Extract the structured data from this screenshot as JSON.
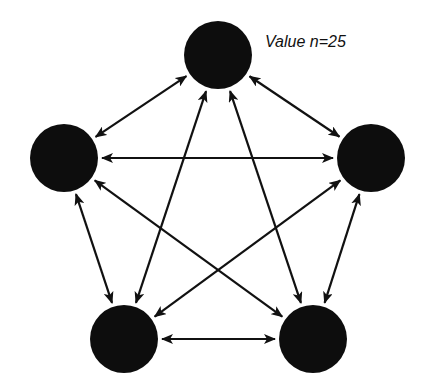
{
  "annotation": {
    "text": "Value n=25",
    "x": 265,
    "y": 33
  },
  "colors": {
    "node": "#0d0d0d",
    "edge": "#111111",
    "background": "#ffffff"
  },
  "nodes": [
    {
      "id": "top",
      "x": 218,
      "y": 55,
      "r": 34
    },
    {
      "id": "left",
      "x": 64,
      "y": 158,
      "r": 34
    },
    {
      "id": "right",
      "x": 371,
      "y": 158,
      "r": 34
    },
    {
      "id": "bottom-left",
      "x": 124,
      "y": 339,
      "r": 34
    },
    {
      "id": "bottom-right",
      "x": 313,
      "y": 339,
      "r": 34
    }
  ],
  "edges": [
    {
      "from": "top",
      "to": "left",
      "bidirectional": true
    },
    {
      "from": "top",
      "to": "right",
      "bidirectional": true
    },
    {
      "from": "top",
      "to": "bottom-left",
      "bidirectional": true
    },
    {
      "from": "top",
      "to": "bottom-right",
      "bidirectional": true
    },
    {
      "from": "left",
      "to": "right",
      "bidirectional": true
    },
    {
      "from": "left",
      "to": "bottom-left",
      "bidirectional": true
    },
    {
      "from": "left",
      "to": "bottom-right",
      "bidirectional": true
    },
    {
      "from": "right",
      "to": "bottom-left",
      "bidirectional": true
    },
    {
      "from": "right",
      "to": "bottom-right",
      "bidirectional": true
    },
    {
      "from": "bottom-left",
      "to": "bottom-right",
      "bidirectional": true
    }
  ]
}
